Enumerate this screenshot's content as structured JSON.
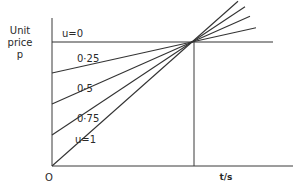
{
  "diagram": {
    "y_axis_label": [
      "Unit",
      "price",
      "p"
    ],
    "x_axis_label": "t/s",
    "origin_label": "O",
    "lines": [
      {
        "u": 0,
        "label": "u=0"
      },
      {
        "u": 0.25,
        "label": "0·25"
      },
      {
        "u": 0.5,
        "label": "0·5"
      },
      {
        "u": 0.75,
        "label": "0·75"
      },
      {
        "u": 1,
        "label": "u=1"
      }
    ],
    "line_color": "#333333"
  }
}
